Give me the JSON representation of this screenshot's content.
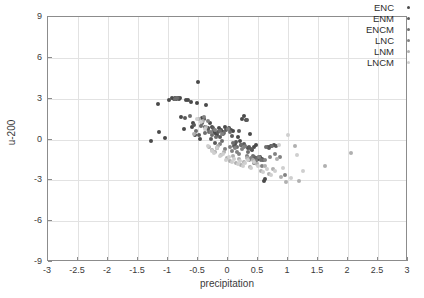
{
  "chart_data": {
    "type": "scatter",
    "title": "",
    "xlabel": "precipitation",
    "ylabel": "u-200",
    "xlim": [
      -3,
      3
    ],
    "ylim": [
      -9,
      9
    ],
    "xticks": [
      -3,
      -2.5,
      -2,
      -1.5,
      -1,
      -0.5,
      0,
      0.5,
      1,
      1.5,
      2,
      2.5,
      3
    ],
    "xticklabels": [
      "-3",
      "-2.5",
      "-2",
      "-1.5",
      "-1",
      "-0.5",
      "0",
      "0.5",
      "1",
      "1.5",
      "2",
      "2.5",
      "3"
    ],
    "yticks": [
      -9,
      -6,
      -3,
      0,
      3,
      6,
      9
    ],
    "yticklabels": [
      "-9",
      "-6",
      "-3",
      "0",
      "3",
      "6",
      "9"
    ],
    "grid": true,
    "legend_position": "top-right",
    "series": [
      {
        "name": "ENC",
        "color": "#4a4a4a",
        "marker_size": 4,
        "points": [
          [
            -1.28,
            -0.1
          ],
          [
            -1.16,
            2.62
          ],
          [
            -1.15,
            0.55
          ],
          [
            -1.05,
            0.12
          ],
          [
            -0.99,
            2.92
          ],
          [
            -0.94,
            3.02
          ],
          [
            -0.9,
            2.98
          ],
          [
            -0.88,
            3.02
          ],
          [
            -0.86,
            2.95
          ],
          [
            -0.84,
            3.08
          ],
          [
            -0.82,
            2.99
          ],
          [
            -0.8,
            3.05
          ],
          [
            -0.78,
            1.62
          ],
          [
            -0.74,
            0.75
          ],
          [
            -0.7,
            2.92
          ],
          [
            -0.66,
            2.88
          ],
          [
            -0.62,
            2.72
          ],
          [
            -0.6,
            0.92
          ],
          [
            -0.58,
            1.22
          ],
          [
            -0.55,
            0.3
          ],
          [
            -0.52,
            2.7
          ],
          [
            -0.5,
            4.22
          ],
          [
            -0.47,
            0.05
          ],
          [
            -0.44,
            1.55
          ],
          [
            -0.4,
            1.48
          ],
          [
            -0.36,
            2.55
          ],
          [
            -0.33,
            0.82
          ],
          [
            -0.3,
            1.18
          ],
          [
            -0.27,
            0.95
          ],
          [
            -0.24,
            0.62
          ],
          [
            -0.21,
            0.45
          ],
          [
            -0.18,
            0.3
          ],
          [
            -0.15,
            0.88
          ],
          [
            -0.12,
            0.72
          ],
          [
            -0.09,
            0.55
          ],
          [
            -0.05,
            0.9
          ],
          [
            -0.02,
            0.78
          ],
          [
            0.02,
            0.85
          ],
          [
            0.05,
            0.72
          ],
          [
            0.08,
            0.62
          ],
          [
            0.12,
            -0.32
          ],
          [
            0.16,
            0.18
          ],
          [
            0.2,
            -0.12
          ],
          [
            0.24,
            1.52
          ],
          [
            0.27,
            1.72
          ],
          [
            0.3,
            1.4
          ],
          [
            0.33,
            -0.65
          ],
          [
            0.36,
            0.42
          ],
          [
            0.4,
            -0.78
          ],
          [
            0.44,
            -0.55
          ],
          [
            0.47,
            -0.42
          ],
          [
            0.5,
            -1.42
          ],
          [
            0.53,
            -1.32
          ],
          [
            0.56,
            -1.45
          ],
          [
            0.6,
            -3.08
          ],
          [
            0.62,
            -2.92
          ],
          [
            0.66,
            -0.52
          ],
          [
            0.72,
            -0.48
          ],
          [
            0.76,
            -0.42
          ]
        ]
      },
      {
        "name": "ENM",
        "color": "#5a5a5a",
        "marker_size": 4,
        "points": [
          [
            -0.86,
            2.98
          ],
          [
            -0.83,
            3.06
          ],
          [
            -0.72,
            1.58
          ],
          [
            -0.56,
            1.1
          ],
          [
            -0.49,
            0.35
          ],
          [
            -0.43,
            1.18
          ],
          [
            -0.38,
            0.92
          ],
          [
            -0.34,
            0.78
          ],
          [
            -0.29,
            0.05
          ],
          [
            -0.25,
            0.88
          ],
          [
            -0.22,
            -0.28
          ],
          [
            -0.17,
            0.55
          ],
          [
            -0.13,
            0.22
          ],
          [
            -0.08,
            0.42
          ],
          [
            -0.04,
            0.68
          ],
          [
            0.01,
            0.78
          ],
          [
            0.06,
            0.28
          ],
          [
            0.1,
            -0.48
          ],
          [
            0.14,
            -0.2
          ],
          [
            0.18,
            0.62
          ],
          [
            0.22,
            -0.42
          ],
          [
            0.26,
            -0.3
          ],
          [
            0.31,
            1.45
          ],
          [
            0.35,
            -0.55
          ],
          [
            0.39,
            -0.72
          ],
          [
            0.43,
            -1.32
          ],
          [
            0.46,
            -1.38
          ],
          [
            0.52,
            -1.3
          ],
          [
            0.58,
            -1.52
          ],
          [
            0.68,
            -0.62
          ],
          [
            0.8,
            -0.45
          ]
        ]
      },
      {
        "name": "ENCM",
        "color": "#6e6e6e",
        "marker_size": 4,
        "points": [
          [
            -0.88,
            3.0
          ],
          [
            -0.85,
            3.04
          ],
          [
            -0.64,
            1.72
          ],
          [
            -0.53,
            0.62
          ],
          [
            -0.45,
            1.02
          ],
          [
            -0.39,
            0.45
          ],
          [
            -0.31,
            0.55
          ],
          [
            -0.26,
            0.32
          ],
          [
            -0.2,
            0.15
          ],
          [
            -0.14,
            0.6
          ],
          [
            -0.1,
            -0.12
          ],
          [
            -0.06,
            0.5
          ],
          [
            0.0,
            0.8
          ],
          [
            0.04,
            0.55
          ],
          [
            0.09,
            -0.25
          ],
          [
            0.15,
            -0.55
          ],
          [
            0.21,
            -0.38
          ],
          [
            0.28,
            -0.48
          ],
          [
            0.34,
            -0.92
          ],
          [
            0.41,
            -1.2
          ],
          [
            0.48,
            -1.35
          ],
          [
            0.55,
            -1.48
          ],
          [
            0.63,
            -0.58
          ],
          [
            0.74,
            -0.5
          ]
        ]
      },
      {
        "name": "LNC",
        "color": "#828282",
        "marker_size": 4,
        "points": [
          [
            -0.4,
            1.62
          ],
          [
            -0.34,
            1.38
          ],
          [
            -0.28,
            0.55
          ],
          [
            -0.22,
            0.72
          ],
          [
            -0.18,
            -0.62
          ],
          [
            -0.14,
            -0.35
          ],
          [
            -0.1,
            0.42
          ],
          [
            -0.05,
            -0.7
          ],
          [
            0.0,
            0.75
          ],
          [
            0.03,
            -0.52
          ],
          [
            0.07,
            -0.85
          ],
          [
            0.11,
            -0.62
          ],
          [
            0.15,
            -0.95
          ],
          [
            0.19,
            -1.05
          ],
          [
            0.23,
            -0.72
          ],
          [
            0.27,
            -0.58
          ],
          [
            0.31,
            -1.18
          ],
          [
            0.35,
            -1.52
          ],
          [
            0.39,
            -1.35
          ],
          [
            0.43,
            -1.72
          ],
          [
            0.47,
            -1.58
          ],
          [
            0.52,
            -1.28
          ],
          [
            0.57,
            -1.95
          ],
          [
            0.62,
            -1.48
          ],
          [
            0.7,
            -1.32
          ],
          [
            0.78,
            -1.1
          ],
          [
            0.86,
            -1.25
          ],
          [
            0.95,
            -2.62
          ]
        ]
      },
      {
        "name": "LNM",
        "color": "#b0b0b0",
        "marker_size": 4,
        "points": [
          [
            -0.57,
            0.42
          ],
          [
            -0.48,
            1.48
          ],
          [
            -0.42,
            1.35
          ],
          [
            -0.36,
            0.92
          ],
          [
            -0.31,
            -0.55
          ],
          [
            -0.26,
            -0.78
          ],
          [
            -0.21,
            -0.92
          ],
          [
            -0.16,
            -0.5
          ],
          [
            -0.11,
            -1.12
          ],
          [
            -0.07,
            -0.95
          ],
          [
            -0.02,
            -1.38
          ],
          [
            0.03,
            -1.55
          ],
          [
            0.08,
            -1.22
          ],
          [
            0.13,
            -1.7
          ],
          [
            0.18,
            -1.45
          ],
          [
            0.22,
            -1.88
          ],
          [
            0.27,
            -1.62
          ],
          [
            0.32,
            -1.38
          ],
          [
            0.37,
            -2.05
          ],
          [
            0.42,
            -1.52
          ],
          [
            0.48,
            -1.8
          ],
          [
            0.55,
            -2.28
          ],
          [
            0.61,
            -1.95
          ],
          [
            0.68,
            -2.55
          ],
          [
            0.75,
            -2.15
          ],
          [
            0.82,
            -1.45
          ],
          [
            0.88,
            -2.75
          ],
          [
            0.97,
            -3.15
          ],
          [
            1.12,
            -0.48
          ],
          [
            1.18,
            -3.02
          ],
          [
            1.62,
            -1.92
          ],
          [
            2.05,
            -1.02
          ]
        ]
      },
      {
        "name": "LNCM",
        "color": "#cfcfcf",
        "marker_size": 4,
        "points": [
          [
            -0.52,
            1.52
          ],
          [
            -0.45,
            1.28
          ],
          [
            -0.38,
            0.78
          ],
          [
            -0.33,
            -0.48
          ],
          [
            -0.27,
            -0.88
          ],
          [
            -0.23,
            -1.02
          ],
          [
            -0.19,
            -0.62
          ],
          [
            -0.13,
            -1.22
          ],
          [
            -0.08,
            -1.05
          ],
          [
            -0.03,
            -1.48
          ],
          [
            0.02,
            -1.3
          ],
          [
            0.06,
            -1.65
          ],
          [
            0.1,
            -1.42
          ],
          [
            0.16,
            -1.78
          ],
          [
            0.2,
            -1.58
          ],
          [
            0.25,
            -1.95
          ],
          [
            0.29,
            -1.72
          ],
          [
            0.34,
            -1.48
          ],
          [
            0.38,
            -2.12
          ],
          [
            0.44,
            -1.68
          ],
          [
            0.5,
            -1.92
          ],
          [
            0.58,
            -2.42
          ],
          [
            0.65,
            -2.18
          ],
          [
            0.72,
            -2.62
          ],
          [
            0.79,
            -2.32
          ],
          [
            0.85,
            -0.38
          ],
          [
            0.92,
            -2.1
          ],
          [
            1.0,
            0.3
          ],
          [
            1.05,
            -2.82
          ],
          [
            1.15,
            -1.12
          ],
          [
            1.25,
            -2.35
          ]
        ]
      }
    ]
  },
  "axes": {
    "x_title": "precipitation",
    "y_title": "u-200"
  },
  "legend": {
    "entries": [
      {
        "label": "ENC",
        "color": "#4a4a4a"
      },
      {
        "label": "ENM",
        "color": "#5a5a5a"
      },
      {
        "label": "ENCM",
        "color": "#6e6e6e"
      },
      {
        "label": "LNC",
        "color": "#828282"
      },
      {
        "label": "LNM",
        "color": "#b0b0b0"
      },
      {
        "label": "LNCM",
        "color": "#cfcfcf"
      }
    ]
  }
}
